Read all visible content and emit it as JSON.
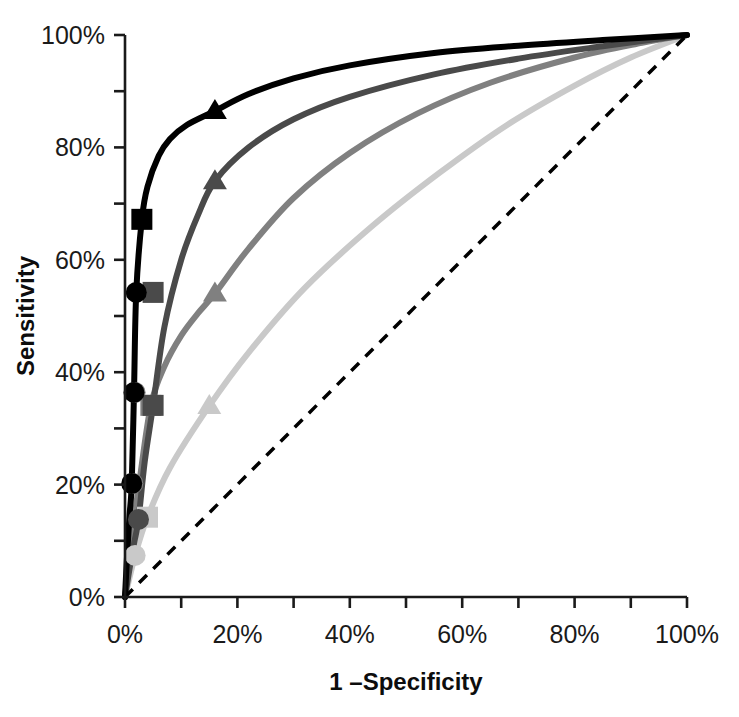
{
  "chart_data": {
    "type": "line",
    "title": "",
    "xlabel": "1 –Specificity",
    "ylabel": "Sensitivity",
    "xlim": [
      0,
      100
    ],
    "ylim": [
      0,
      100
    ],
    "grid": false,
    "legend": "none",
    "x_ticks": [
      0,
      20,
      40,
      60,
      80,
      100
    ],
    "x_tick_labels": [
      "0%",
      "20%",
      "40%",
      "60%",
      "80%",
      "100%"
    ],
    "x_minor_ticks": [
      10,
      30,
      50,
      70,
      90
    ],
    "y_ticks": [
      0,
      20,
      40,
      60,
      80,
      100
    ],
    "y_tick_labels": [
      "0%",
      "20%",
      "40%",
      "60%",
      "80%",
      "100%"
    ],
    "y_minor_ticks": [
      10,
      30,
      50,
      70,
      90
    ],
    "reference_line": {
      "name": "chance-diagonal",
      "style": "dashed",
      "color": "#000000",
      "x": [
        0,
        100
      ],
      "y": [
        0,
        100
      ]
    },
    "series": [
      {
        "name": "curve-1",
        "color": "#000000",
        "width": 6,
        "markers": [
          {
            "shape": "circle",
            "x": 1.2,
            "y": 20.2
          },
          {
            "shape": "circle",
            "x": 1.6,
            "y": 36.4
          },
          {
            "shape": "circle",
            "x": 2.0,
            "y": 54.2
          },
          {
            "shape": "square",
            "x": 3.0,
            "y": 67.2
          },
          {
            "shape": "triangle",
            "x": 16.0,
            "y": 86.5
          }
        ],
        "x": [
          0,
          0.4,
          0.8,
          1.2,
          1.6,
          2.0,
          3.0,
          4.0,
          6.0,
          8.0,
          11.0,
          16.0,
          22.0,
          30.0,
          40.0,
          55.0,
          70.0,
          85.0,
          100.0
        ],
        "y": [
          0,
          8.0,
          14.5,
          20.2,
          36.4,
          54.2,
          67.2,
          73.0,
          78.5,
          81.5,
          84.0,
          86.5,
          89.5,
          92.3,
          94.6,
          96.8,
          98.1,
          99.1,
          100.0
        ]
      },
      {
        "name": "curve-2",
        "color": "#4a4a4a",
        "width": 6,
        "markers": [
          {
            "shape": "circle",
            "x": 2.4,
            "y": 13.8
          },
          {
            "shape": "square",
            "x": 5.0,
            "y": 34.1
          },
          {
            "shape": "square",
            "x": 5.0,
            "y": 54.2
          },
          {
            "shape": "triangle",
            "x": 16.0,
            "y": 74.0
          }
        ],
        "x": [
          0,
          0.8,
          1.6,
          2.4,
          3.5,
          5.0,
          7.0,
          10.0,
          13.0,
          16.0,
          22.0,
          30.0,
          40.0,
          55.0,
          70.0,
          85.0,
          100.0
        ],
        "y": [
          0,
          5.0,
          9.5,
          13.8,
          24.0,
          34.1,
          48.0,
          60.0,
          68.0,
          74.0,
          80.0,
          85.0,
          89.0,
          93.0,
          95.8,
          98.0,
          100.0
        ]
      },
      {
        "name": "curve-3",
        "color": "#808080",
        "width": 6,
        "markers": [
          {
            "shape": "circle",
            "x": 1.4,
            "y": 20.2
          },
          {
            "shape": "circle",
            "x": 1.8,
            "y": 36.4
          },
          {
            "shape": "square",
            "x": 4.6,
            "y": 34.1
          },
          {
            "shape": "triangle",
            "x": 16.0,
            "y": 54.0
          }
        ],
        "x": [
          0,
          1.0,
          2.5,
          4.6,
          7.0,
          10.0,
          13.0,
          16.0,
          22.0,
          30.0,
          40.0,
          52.0,
          65.0,
          80.0,
          92.0,
          100.0
        ],
        "y": [
          0,
          9.0,
          20.0,
          34.1,
          41.0,
          46.5,
          50.5,
          54.0,
          62.0,
          71.0,
          79.0,
          86.0,
          91.5,
          96.0,
          98.6,
          100.0
        ]
      },
      {
        "name": "curve-4",
        "color": "#c9c9c9",
        "width": 6,
        "markers": [
          {
            "shape": "circle",
            "x": 1.8,
            "y": 7.4
          },
          {
            "shape": "square",
            "x": 4.0,
            "y": 14.2
          },
          {
            "shape": "triangle",
            "x": 15.0,
            "y": 34.0
          }
        ],
        "x": [
          0,
          1.8,
          4.0,
          8.0,
          15.0,
          22.0,
          32.0,
          44.0,
          56.0,
          68.0,
          80.0,
          90.0,
          100.0
        ],
        "y": [
          0,
          7.4,
          14.2,
          23.0,
          34.0,
          43.5,
          55.0,
          66.0,
          75.5,
          84.0,
          91.0,
          96.0,
          100.0
        ]
      }
    ]
  },
  "axes": {
    "x_title": "1 –Specificity",
    "y_title": "Sensitivity",
    "x_labels": [
      "0%",
      "20%",
      "40%",
      "60%",
      "80%",
      "100%"
    ],
    "y_labels": [
      "0%",
      "20%",
      "40%",
      "60%",
      "80%",
      "100%"
    ],
    "axis_color": "#1a1a1a"
  }
}
